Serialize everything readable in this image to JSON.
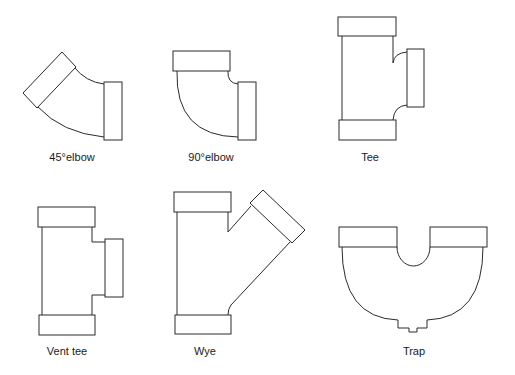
{
  "figure": {
    "type": "pipe-fittings-diagram",
    "colors": {
      "stroke": "#2a2a2a",
      "background": "#ffffff",
      "text": "#1a1a1a"
    },
    "fittings": [
      {
        "id": "elbow-45",
        "label": "45°elbow"
      },
      {
        "id": "elbow-90",
        "label": "90°elbow"
      },
      {
        "id": "tee",
        "label": "Tee"
      },
      {
        "id": "vent-tee",
        "label": "Vent tee"
      },
      {
        "id": "wye",
        "label": "Wye"
      },
      {
        "id": "trap",
        "label": "Trap"
      }
    ]
  }
}
